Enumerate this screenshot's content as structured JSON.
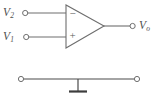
{
  "diagram": {
    "background_color": "#ffffff",
    "line_color": "#6e6e6e",
    "label_color": "#4f4f4f",
    "ground_color": "#3d3d3d"
  },
  "opamp": {
    "name": "operational-amplifier",
    "shape": "triangle",
    "inverting_sign": "−",
    "noninverting_sign": "+"
  },
  "ports": {
    "input_top": {
      "base": "V",
      "subscript": "2",
      "full": "V2",
      "polarity": "inverting"
    },
    "input_bottom": {
      "base": "V",
      "subscript": "1",
      "full": "V1",
      "polarity": "non-inverting"
    },
    "output": {
      "base": "V",
      "subscript": "o",
      "full": "Vo",
      "polarity": "output"
    }
  },
  "ground_rail": {
    "name": "ground-rail",
    "symbol": "earth-ground",
    "left_terminal": "open-circle",
    "right_terminal": "open-circle"
  }
}
